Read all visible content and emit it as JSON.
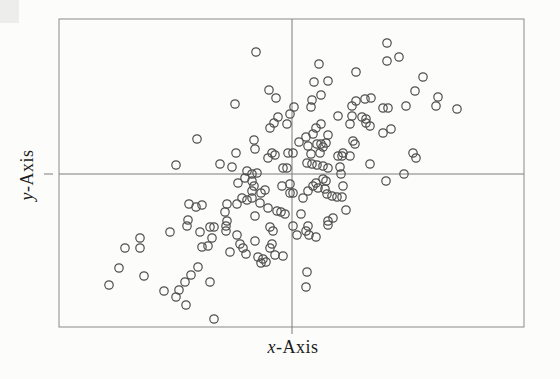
{
  "chart_data": {
    "type": "scatter",
    "title": "",
    "xlabel": "x-Axis",
    "ylabel": "y-Axis",
    "xlabel_var": "x",
    "xlabel_rest": "-Axis",
    "ylabel_var": "y",
    "ylabel_rest": "-Axis",
    "legend": null,
    "axis_tick_labels": "none",
    "marker": "open-circle",
    "marker_radius_px": 4.2,
    "marker_stroke_width": 1.2,
    "colors": {
      "frame": "#8a8a8a",
      "crosshair": "#7d7d7d",
      "marker": "#4f4f4f",
      "background": "#fcfcfa"
    },
    "frame_px": {
      "left": 59,
      "top": 19,
      "right": 524,
      "bottom": 327
    },
    "hline_px": {
      "y": 174,
      "x1": 59,
      "x2": 524,
      "tick_x1": 44,
      "tick_x2": 53
    },
    "vline_px": {
      "x": 292,
      "y1": 19,
      "y2": 334
    },
    "points_px": [
      [
        256,
        52
      ],
      [
        269,
        90
      ],
      [
        276,
        98
      ],
      [
        235,
        104
      ],
      [
        278,
        117
      ],
      [
        290,
        114
      ],
      [
        387,
        43
      ],
      [
        387,
        61
      ],
      [
        399,
        57
      ],
      [
        319,
        64
      ],
      [
        356,
        72
      ],
      [
        328,
        81
      ],
      [
        314,
        82
      ],
      [
        321,
        95
      ],
      [
        312,
        100
      ],
      [
        311,
        107
      ],
      [
        294,
        107
      ],
      [
        356,
        101
      ],
      [
        365,
        99
      ],
      [
        371,
        98
      ],
      [
        352,
        106
      ],
      [
        383,
        108
      ],
      [
        388,
        108
      ],
      [
        406,
        106
      ],
      [
        338,
        116
      ],
      [
        352,
        116
      ],
      [
        362,
        117
      ],
      [
        366,
        119
      ],
      [
        423,
        77
      ],
      [
        415,
        91
      ],
      [
        438,
        97
      ],
      [
        436,
        106
      ],
      [
        457,
        109
      ],
      [
        197,
        139
      ],
      [
        176,
        165
      ],
      [
        220,
        164
      ],
      [
        232,
        167
      ],
      [
        236,
        153
      ],
      [
        254,
        140
      ],
      [
        255,
        149
      ],
      [
        270,
        128
      ],
      [
        274,
        123
      ],
      [
        287,
        124
      ],
      [
        272,
        153
      ],
      [
        275,
        155
      ],
      [
        268,
        158
      ],
      [
        288,
        153
      ],
      [
        283,
        168
      ],
      [
        287,
        168
      ],
      [
        247,
        171
      ],
      [
        252,
        174
      ],
      [
        257,
        173
      ],
      [
        245,
        178
      ],
      [
        238,
        183
      ],
      [
        252,
        181
      ],
      [
        254,
        186
      ],
      [
        252,
        191
      ],
      [
        261,
        193
      ],
      [
        265,
        190
      ],
      [
        242,
        198
      ],
      [
        247,
        200
      ],
      [
        252,
        198
      ],
      [
        260,
        203
      ],
      [
        237,
        204
      ],
      [
        227,
        204
      ],
      [
        189,
        204
      ],
      [
        196,
        207
      ],
      [
        202,
        205
      ],
      [
        225,
        212
      ],
      [
        255,
        216
      ],
      [
        268,
        208
      ],
      [
        277,
        211
      ],
      [
        281,
        212
      ],
      [
        285,
        214
      ],
      [
        188,
        220
      ],
      [
        227,
        221
      ],
      [
        282,
        186
      ],
      [
        290,
        184
      ],
      [
        290,
        193
      ],
      [
        316,
        128
      ],
      [
        321,
        124
      ],
      [
        350,
        124
      ],
      [
        366,
        123
      ],
      [
        370,
        126
      ],
      [
        383,
        133
      ],
      [
        391,
        129
      ],
      [
        306,
        137
      ],
      [
        313,
        134
      ],
      [
        328,
        135
      ],
      [
        299,
        142
      ],
      [
        308,
        146
      ],
      [
        317,
        144
      ],
      [
        321,
        144
      ],
      [
        323,
        147
      ],
      [
        326,
        143
      ],
      [
        353,
        141
      ],
      [
        355,
        144
      ],
      [
        293,
        153
      ],
      [
        311,
        154
      ],
      [
        320,
        153
      ],
      [
        338,
        156
      ],
      [
        342,
        156
      ],
      [
        343,
        153
      ],
      [
        350,
        156
      ],
      [
        370,
        164
      ],
      [
        307,
        163
      ],
      [
        312,
        164
      ],
      [
        317,
        165
      ],
      [
        323,
        166
      ],
      [
        328,
        168
      ],
      [
        340,
        167
      ],
      [
        341,
        174
      ],
      [
        404,
        174
      ],
      [
        386,
        181
      ],
      [
        323,
        179
      ],
      [
        326,
        181
      ],
      [
        316,
        183
      ],
      [
        318,
        188
      ],
      [
        313,
        186
      ],
      [
        308,
        191
      ],
      [
        325,
        189
      ],
      [
        327,
        194
      ],
      [
        332,
        196
      ],
      [
        337,
        197
      ],
      [
        342,
        197
      ],
      [
        343,
        186
      ],
      [
        293,
        193
      ],
      [
        303,
        198
      ],
      [
        301,
        214
      ],
      [
        333,
        218
      ],
      [
        346,
        210
      ],
      [
        328,
        221
      ],
      [
        413,
        153
      ],
      [
        416,
        158
      ],
      [
        170,
        232
      ],
      [
        140,
        238
      ],
      [
        125,
        248
      ],
      [
        140,
        248
      ],
      [
        119,
        268
      ],
      [
        144,
        276
      ],
      [
        109,
        285
      ],
      [
        164,
        291
      ],
      [
        187,
        226
      ],
      [
        200,
        232
      ],
      [
        210,
        227
      ],
      [
        214,
        227
      ],
      [
        226,
        226
      ],
      [
        226,
        231
      ],
      [
        237,
        235
      ],
      [
        212,
        238
      ],
      [
        202,
        247
      ],
      [
        208,
        246
      ],
      [
        230,
        252
      ],
      [
        240,
        244
      ],
      [
        243,
        248
      ],
      [
        246,
        254
      ],
      [
        255,
        241
      ],
      [
        270,
        227
      ],
      [
        273,
        231
      ],
      [
        272,
        244
      ],
      [
        270,
        248
      ],
      [
        258,
        257
      ],
      [
        263,
        259
      ],
      [
        261,
        263
      ],
      [
        266,
        262
      ],
      [
        275,
        255
      ],
      [
        283,
        256
      ],
      [
        198,
        267
      ],
      [
        191,
        275
      ],
      [
        185,
        282
      ],
      [
        210,
        282
      ],
      [
        179,
        290
      ],
      [
        176,
        297
      ],
      [
        186,
        305
      ],
      [
        214,
        319
      ],
      [
        308,
        226
      ],
      [
        306,
        231
      ],
      [
        309,
        235
      ],
      [
        297,
        235
      ],
      [
        293,
        226
      ],
      [
        316,
        237
      ],
      [
        328,
        225
      ],
      [
        307,
        272
      ],
      [
        306,
        287
      ]
    ]
  }
}
